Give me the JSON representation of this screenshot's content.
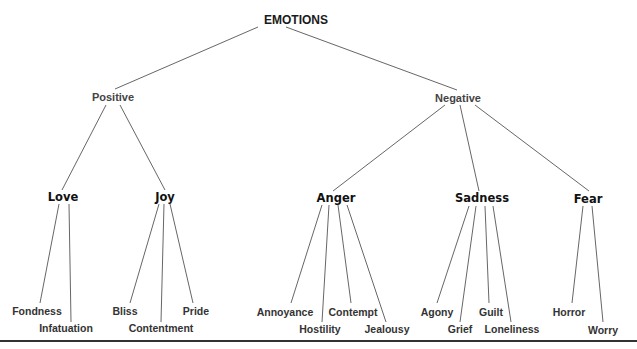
{
  "diagram": {
    "type": "tree",
    "title": "EMOTIONS",
    "root": {
      "label": "EMOTIONS"
    },
    "branches": [
      {
        "label": "Positive",
        "children": [
          {
            "label": "Love",
            "children": [
              "Fondness",
              "Infatuation"
            ]
          },
          {
            "label": "Joy",
            "children": [
              "Bliss",
              "Contentment",
              "Pride"
            ]
          }
        ]
      },
      {
        "label": "Negative",
        "children": [
          {
            "label": "Anger",
            "children": [
              "Annoyance",
              "Hostility",
              "Contempt",
              "Jealousy"
            ]
          },
          {
            "label": "Sadness",
            "children": [
              "Agony",
              "Grief",
              "Guilt",
              "Loneliness"
            ]
          },
          {
            "label": "Fear",
            "children": [
              "Horror",
              "Worry"
            ]
          }
        ]
      }
    ]
  },
  "labels": {
    "root": "EMOTIONS",
    "positive": "Positive",
    "negative": "Negative",
    "love": "Love",
    "joy": "Joy",
    "anger": "Anger",
    "sadness": "Sadness",
    "fear": "Fear",
    "fondness": "Fondness",
    "infatuation": "Infatuation",
    "bliss": "Bliss",
    "contentment": "Contentment",
    "pride": "Pride",
    "annoyance": "Annoyance",
    "hostility": "Hostility",
    "contempt": "Contempt",
    "jealousy": "Jealousy",
    "agony": "Agony",
    "grief": "Grief",
    "guilt": "Guilt",
    "loneliness": "Loneliness",
    "horror": "Horror",
    "worry": "Worry"
  },
  "colors": {
    "background": "#ffffff",
    "text": "#333333",
    "edge": "#555555",
    "baseline": "#333333"
  }
}
